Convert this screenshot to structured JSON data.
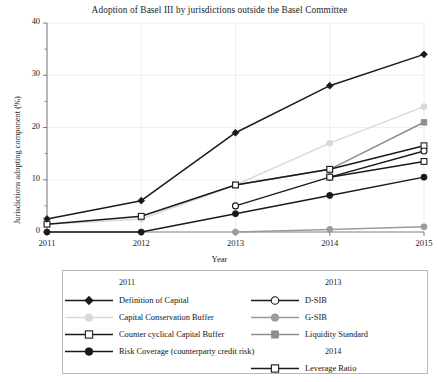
{
  "chart_data": {
    "type": "line",
    "title": "Adoption of Basel III by jurisdictions outside the Basel Committee",
    "xlabel": "Year",
    "ylabel": "Jurisdictions adopting component (%)",
    "x": [
      "2011",
      "2012",
      "2013",
      "2014",
      "2015"
    ],
    "xlim": [
      2011,
      2015
    ],
    "ylim": [
      0,
      40
    ],
    "yticks": [
      0,
      10,
      20,
      30,
      40
    ],
    "yticks_minor": [
      5,
      15,
      25,
      35
    ],
    "grid": "vertical gridlines at each year, light horizontal gridlines at major y ticks",
    "legend_position": "below axes, two columns, bordered box",
    "series": [
      {
        "name": "Definition of Capital",
        "group": "2011",
        "marker": "filled-diamond",
        "color": "#1a1a1a",
        "values": [
          2.5,
          6,
          19,
          28,
          34
        ]
      },
      {
        "name": "Capital Conservation Buffer",
        "group": "2011",
        "marker": "filled-circle",
        "color": "#d9d9d9",
        "values": [
          1.5,
          2.5,
          9,
          17,
          24
        ]
      },
      {
        "name": "Counter cyclical Capital Buffer",
        "group": "2011",
        "marker": "open-square",
        "color": "#1a1a1a",
        "values": [
          1.5,
          3,
          9,
          12,
          16.5
        ]
      },
      {
        "name": "Risk Coverage (counterparty credit risk)",
        "group": "2011",
        "marker": "filled-circle",
        "color": "#1a1a1a",
        "values": [
          0,
          0,
          3.5,
          7,
          10.5
        ]
      },
      {
        "name": "D-SIB",
        "group": "2013",
        "marker": "open-circle",
        "color": "#1a1a1a",
        "values": [
          null,
          null,
          5,
          10.5,
          15.5
        ]
      },
      {
        "name": "G-SIB",
        "group": "2013",
        "marker": "filled-circle",
        "color": "#9b9b9b",
        "values": [
          null,
          null,
          0,
          0.5,
          1
        ]
      },
      {
        "name": "Liquidity Standard",
        "group": "2013",
        "marker": "filled-square",
        "color": "#8d8d8d",
        "values": [
          null,
          null,
          9,
          12,
          21
        ]
      },
      {
        "name": "Leverage Ratio",
        "group": "2014",
        "marker": "open-square",
        "color": "#1a1a1a",
        "values": [
          null,
          null,
          null,
          10.5,
          13.5
        ]
      }
    ]
  },
  "legend": {
    "columns": [
      {
        "header": "2011",
        "entries": [
          {
            "label": "Definition of Capital"
          },
          {
            "label": "Capital Conservation Buffer"
          },
          {
            "label": "Counter cyclical Capital Buffer"
          },
          {
            "label": "Risk Coverage (counterparty credit risk)"
          }
        ]
      },
      {
        "header": "2013",
        "entries": [
          {
            "label": "D-SIB"
          },
          {
            "label": "G-SIB"
          },
          {
            "label": "Liquidity Standard"
          }
        ],
        "header2": "2014",
        "entries2": [
          {
            "label": "Leverage Ratio"
          }
        ]
      }
    ]
  },
  "axis": {
    "y_ticklabels": [
      "0",
      "10",
      "20",
      "30",
      "40"
    ],
    "x_ticklabels": [
      "2011",
      "2012",
      "2013",
      "2014",
      "2015"
    ]
  },
  "colors": {
    "ink": "#1a1a1a",
    "grid": "#eeeeee",
    "axis": "#6e6e6e",
    "light_gray": "#d9d9d9",
    "mid_gray": "#9b9b9b",
    "dark_gray": "#8d8d8d",
    "legend_border": "#b9b9b9"
  }
}
